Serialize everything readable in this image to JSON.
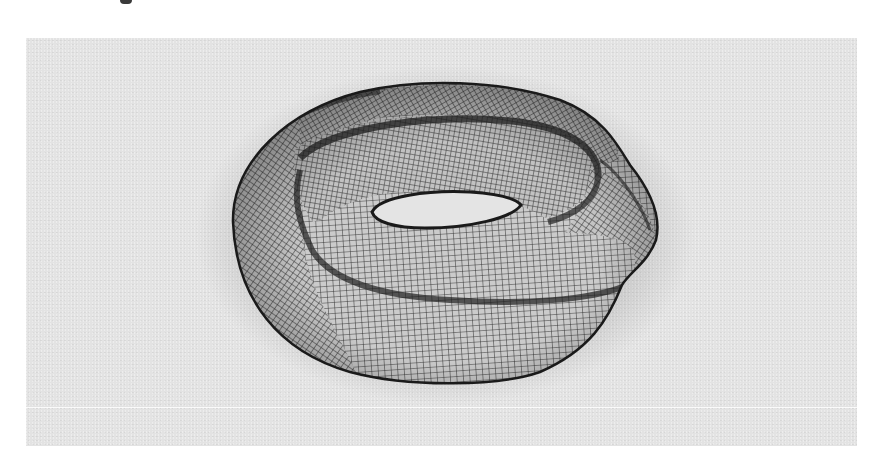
{
  "figure": {
    "background_color": "#e3e3e3",
    "mesh_fill_color": "#c9c9c9",
    "mesh_line_color": "#2e2e2e",
    "hole_color": "#e6e6e6"
  }
}
